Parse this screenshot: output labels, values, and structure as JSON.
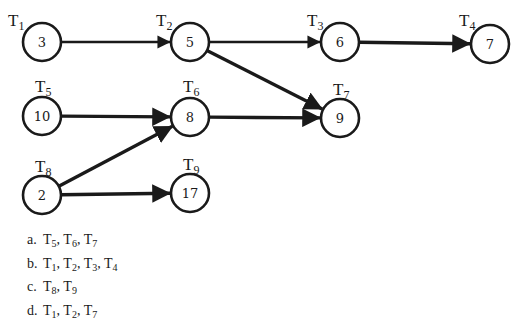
{
  "diagram": {
    "type": "task-dependency-graph",
    "nodes": [
      {
        "id": "T1",
        "label": "T",
        "sub": "1",
        "value": "3",
        "cx": 42,
        "cy": 42,
        "lx": 8,
        "ly": 26
      },
      {
        "id": "T2",
        "label": "T",
        "sub": "2",
        "value": "5",
        "cx": 190,
        "cy": 42,
        "lx": 156,
        "ly": 26
      },
      {
        "id": "T3",
        "label": "T",
        "sub": "3",
        "value": "6",
        "cx": 340,
        "cy": 42,
        "lx": 307,
        "ly": 26
      },
      {
        "id": "T4",
        "label": "T",
        "sub": "4",
        "value": "7",
        "cx": 490,
        "cy": 44,
        "lx": 459,
        "ly": 26
      },
      {
        "id": "T5",
        "label": "T",
        "sub": "5",
        "value": "10",
        "cx": 42,
        "cy": 116,
        "lx": 35,
        "ly": 92
      },
      {
        "id": "T6",
        "label": "T",
        "sub": "6",
        "value": "8",
        "cx": 190,
        "cy": 117,
        "lx": 183,
        "ly": 92
      },
      {
        "id": "T7",
        "label": "T",
        "sub": "7",
        "value": "9",
        "cx": 340,
        "cy": 118,
        "lx": 333,
        "ly": 95
      },
      {
        "id": "T8",
        "label": "T",
        "sub": "8",
        "value": "2",
        "cx": 42,
        "cy": 195,
        "lx": 35,
        "ly": 172
      },
      {
        "id": "T9",
        "label": "T",
        "sub": "9",
        "value": "17",
        "cx": 190,
        "cy": 193,
        "lx": 183,
        "ly": 170
      }
    ],
    "edges": [
      {
        "from": "T1",
        "to": "T2"
      },
      {
        "from": "T2",
        "to": "T3"
      },
      {
        "from": "T3",
        "to": "T4"
      },
      {
        "from": "T2",
        "to": "T7"
      },
      {
        "from": "T5",
        "to": "T6"
      },
      {
        "from": "T6",
        "to": "T7"
      },
      {
        "from": "T8",
        "to": "T6"
      },
      {
        "from": "T8",
        "to": "T9"
      }
    ]
  },
  "options": [
    {
      "letter": "a.",
      "tasks": [
        [
          "T",
          "5"
        ],
        [
          "T",
          "6"
        ],
        [
          "T",
          "7"
        ]
      ]
    },
    {
      "letter": "b.",
      "tasks": [
        [
          "T",
          "1"
        ],
        [
          "T",
          "2"
        ],
        [
          "T",
          "3"
        ],
        [
          "T",
          "4"
        ]
      ]
    },
    {
      "letter": "c.",
      "tasks": [
        [
          "T",
          "8"
        ],
        [
          "T",
          "9"
        ]
      ]
    },
    {
      "letter": "d.",
      "tasks": [
        [
          "T",
          "1"
        ],
        [
          "T",
          "2"
        ],
        [
          "T",
          "7"
        ]
      ]
    }
  ],
  "colors": {
    "ink": "#1a1a1a",
    "background": "#ffffff"
  }
}
